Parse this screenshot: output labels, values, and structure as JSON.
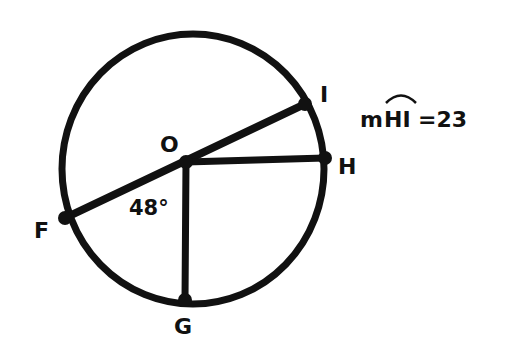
{
  "diagram": {
    "points": {
      "O": "O",
      "I": "I",
      "H": "H",
      "F": "F",
      "G": "G"
    },
    "angle_label": "48°",
    "arc_measure": {
      "prefix": "m",
      "arc": "HI",
      "equals": "=23"
    }
  }
}
